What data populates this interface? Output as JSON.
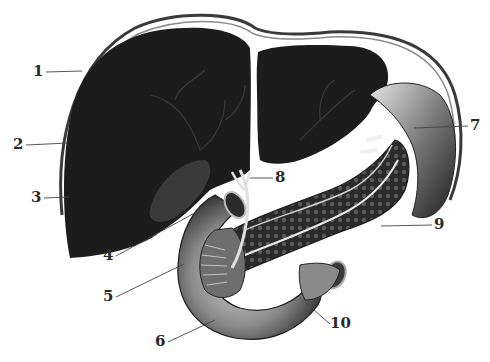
{
  "figure": {
    "type": "anatomical-illustration",
    "colors": {
      "organ_dark": "#1c1c1c",
      "background": "#ffffff",
      "label": "#2a2a2a",
      "leader": "#444444"
    }
  },
  "labels": [
    {
      "num": "1",
      "x": 33,
      "y": 64
    },
    {
      "num": "2",
      "x": 13,
      "y": 137
    },
    {
      "num": "3",
      "x": 31,
      "y": 190
    },
    {
      "num": "4",
      "x": 103,
      "y": 248
    },
    {
      "num": "5",
      "x": 103,
      "y": 289
    },
    {
      "num": "6",
      "x": 155,
      "y": 334
    },
    {
      "num": "7",
      "x": 467,
      "y": 118
    },
    {
      "num": "8",
      "x": 271,
      "y": 170
    },
    {
      "num": "9",
      "x": 432,
      "y": 217
    },
    {
      "num": "10",
      "x": 330,
      "y": 316
    }
  ]
}
